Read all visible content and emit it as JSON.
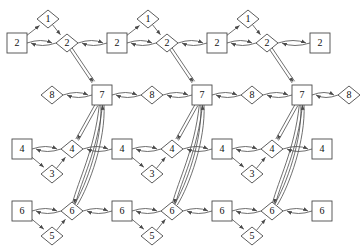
{
  "diagram": {
    "type": "directed-graph",
    "stroke_color": "#4a4a4a",
    "label_color": "#101010",
    "background": "#ffffff",
    "shapes": {
      "square": "place",
      "diamond": "transition"
    },
    "rows": [
      {
        "name": "row-top",
        "y": 43,
        "labels": [
          "2",
          "1",
          "2"
        ]
      },
      {
        "name": "row-middle",
        "y": 95,
        "labels": [
          "8",
          "7"
        ]
      },
      {
        "name": "row-lower",
        "y": 149,
        "labels": [
          "4",
          "3",
          "4"
        ]
      },
      {
        "name": "row-bottom",
        "y": 211,
        "labels": [
          "6",
          "5",
          "6"
        ]
      }
    ],
    "nodes": [
      {
        "id": "s2a",
        "label": "1",
        "shape": "diamond",
        "x": 48,
        "y": 19
      },
      {
        "id": "q2a",
        "label": "2",
        "shape": "square",
        "x": 17,
        "y": 43
      },
      {
        "id": "d2a",
        "label": "2",
        "shape": "diamond",
        "x": 67,
        "y": 43
      },
      {
        "id": "s2b",
        "label": "1",
        "shape": "diamond",
        "x": 148,
        "y": 19
      },
      {
        "id": "q2b",
        "label": "2",
        "shape": "square",
        "x": 117,
        "y": 43
      },
      {
        "id": "d2b",
        "label": "2",
        "shape": "diamond",
        "x": 167,
        "y": 43
      },
      {
        "id": "s2c",
        "label": "1",
        "shape": "diamond",
        "x": 248,
        "y": 19
      },
      {
        "id": "q2c",
        "label": "2",
        "shape": "square",
        "x": 217,
        "y": 43
      },
      {
        "id": "d2c",
        "label": "2",
        "shape": "diamond",
        "x": 267,
        "y": 43
      },
      {
        "id": "q2d",
        "label": "2",
        "shape": "square",
        "x": 320,
        "y": 43
      },
      {
        "id": "d8a",
        "label": "8",
        "shape": "diamond",
        "x": 52,
        "y": 95
      },
      {
        "id": "q7a",
        "label": "7",
        "shape": "square",
        "x": 102,
        "y": 95
      },
      {
        "id": "d8b",
        "label": "8",
        "shape": "diamond",
        "x": 152,
        "y": 95
      },
      {
        "id": "q7b",
        "label": "7",
        "shape": "square",
        "x": 202,
        "y": 95
      },
      {
        "id": "d8c",
        "label": "8",
        "shape": "diamond",
        "x": 252,
        "y": 95
      },
      {
        "id": "q7c",
        "label": "7",
        "shape": "square",
        "x": 302,
        "y": 95
      },
      {
        "id": "d8d",
        "label": "8",
        "shape": "diamond",
        "x": 349,
        "y": 95
      },
      {
        "id": "q4a",
        "label": "4",
        "shape": "square",
        "x": 22,
        "y": 149
      },
      {
        "id": "d4a",
        "label": "4",
        "shape": "diamond",
        "x": 72,
        "y": 149
      },
      {
        "id": "s3a",
        "label": "3",
        "shape": "diamond",
        "x": 52,
        "y": 174
      },
      {
        "id": "q4b",
        "label": "4",
        "shape": "square",
        "x": 122,
        "y": 149
      },
      {
        "id": "d4b",
        "label": "4",
        "shape": "diamond",
        "x": 172,
        "y": 149
      },
      {
        "id": "s3b",
        "label": "3",
        "shape": "diamond",
        "x": 152,
        "y": 174
      },
      {
        "id": "q4c",
        "label": "4",
        "shape": "square",
        "x": 222,
        "y": 149
      },
      {
        "id": "d4c",
        "label": "4",
        "shape": "diamond",
        "x": 272,
        "y": 149
      },
      {
        "id": "s3c",
        "label": "3",
        "shape": "diamond",
        "x": 252,
        "y": 174
      },
      {
        "id": "q4d",
        "label": "4",
        "shape": "square",
        "x": 322,
        "y": 149
      },
      {
        "id": "q6a",
        "label": "6",
        "shape": "square",
        "x": 22,
        "y": 211
      },
      {
        "id": "d6a",
        "label": "6",
        "shape": "diamond",
        "x": 72,
        "y": 211
      },
      {
        "id": "s5a",
        "label": "5",
        "shape": "diamond",
        "x": 52,
        "y": 236
      },
      {
        "id": "q6b",
        "label": "6",
        "shape": "square",
        "x": 122,
        "y": 211
      },
      {
        "id": "d6b",
        "label": "6",
        "shape": "diamond",
        "x": 172,
        "y": 211
      },
      {
        "id": "s5b",
        "label": "5",
        "shape": "diamond",
        "x": 152,
        "y": 236
      },
      {
        "id": "q6c",
        "label": "6",
        "shape": "square",
        "x": 222,
        "y": 211
      },
      {
        "id": "d6c",
        "label": "6",
        "shape": "diamond",
        "x": 272,
        "y": 211
      },
      {
        "id": "s5c",
        "label": "5",
        "shape": "diamond",
        "x": 252,
        "y": 236
      },
      {
        "id": "q6d",
        "label": "6",
        "shape": "square",
        "x": 322,
        "y": 211
      }
    ],
    "group_count": 3,
    "group_pitch": 100
  }
}
